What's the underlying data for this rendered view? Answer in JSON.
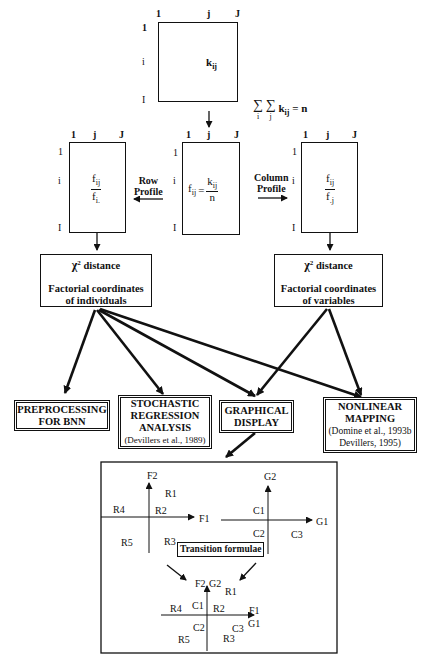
{
  "matrices": {
    "top": {
      "col_labels": [
        "1",
        "j",
        "J"
      ],
      "row_labels": [
        "1",
        "i",
        "I"
      ],
      "cell": "k",
      "cell_sub": "ij",
      "sum_formula": {
        "sigma1_sub": "i",
        "sigma2_sub": "j",
        "term": "k",
        "term_sub": "ij",
        "rhs": "= n"
      }
    },
    "middle": {
      "col_labels": [
        "1",
        "j",
        "J"
      ],
      "row_labels": [
        "1",
        "i",
        "I"
      ],
      "cell_lhs": "f",
      "cell_lhs_sub": "ij",
      "eq": "=",
      "num": "k",
      "num_sub": "ij",
      "den": "n"
    },
    "left": {
      "col_labels": [
        "1",
        "j",
        "J"
      ],
      "row_labels": [
        "1",
        "i",
        "I"
      ],
      "num": "f",
      "num_sub": "ij",
      "den": "f",
      "den_sub": "i."
    },
    "right": {
      "col_labels": [
        "1",
        "j",
        "J"
      ],
      "row_labels": [
        "1",
        "i",
        "I"
      ],
      "num": "f",
      "num_sub": "ij",
      "den": "f",
      "den_sub": ".j"
    }
  },
  "arrows": {
    "row_profile": [
      "Row",
      "Profile"
    ],
    "column_profile": [
      "Column",
      "Profile"
    ]
  },
  "chi_boxes": {
    "individuals": {
      "chi": "χ",
      "sup": "2",
      "distance": "distance",
      "line1": "Factorial coordinates",
      "line2": "of individuals"
    },
    "variables": {
      "chi": "χ",
      "sup": "2",
      "distance": "distance",
      "line1": "Factorial coordinates",
      "line2": "of variables"
    }
  },
  "outputs": [
    {
      "lines": [
        "PREPROCESSING",
        "FOR BNN"
      ],
      "cite": ""
    },
    {
      "lines": [
        "STOCHASTIC",
        "REGRESSION",
        "ANALYSIS"
      ],
      "cite": "(Devillers et al., 1989)"
    },
    {
      "lines": [
        "GRAPHICAL",
        "DISPLAY"
      ],
      "cite": ""
    },
    {
      "lines": [
        "NONLINEAR",
        "MAPPING"
      ],
      "cite": "(Domine et al., 1993b Devillers, 1995)"
    }
  ],
  "graphical_panel": {
    "plot_f": {
      "x_axis": "F1",
      "y_axis": "F2",
      "points": [
        "R1",
        "R2",
        "R3",
        "R4",
        "R5"
      ]
    },
    "plot_g": {
      "x_axis": "G1",
      "y_axis": "G2",
      "points": [
        "C1",
        "C2",
        "C3"
      ]
    },
    "transition_label": "Transition formulae",
    "plot_combined": {
      "x_axes": [
        "F1",
        "G1"
      ],
      "y_axes": [
        "F2",
        "G2"
      ],
      "points": [
        "R1",
        "R2",
        "R3",
        "R4",
        "R5",
        "C1",
        "C2",
        "C3"
      ]
    }
  }
}
